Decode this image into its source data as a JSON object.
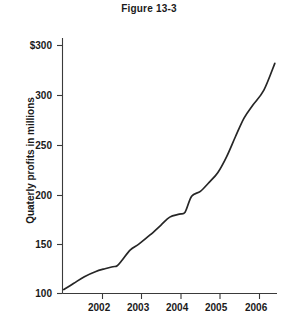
{
  "figure": {
    "title": "Figure 13-3"
  },
  "chart_data": {
    "type": "line",
    "title": "Figure 13-3",
    "xlabel": "",
    "ylabel": "Quaterly profits in millions",
    "grid": false,
    "legend": "none",
    "xlim": [
      2001.75,
      2006.65
    ],
    "ylim": [
      100,
      350
    ],
    "x_tick_labels": [
      "2002",
      "2003",
      "2004",
      "2005",
      "2006"
    ],
    "x_ticks": [
      2002,
      2003,
      2004,
      2005,
      2006
    ],
    "y_tick_labels": [
      "100",
      "150",
      "200",
      "250",
      "300",
      "$300"
    ],
    "y_ticks": [
      100,
      150,
      200,
      250,
      300,
      350
    ],
    "series": [
      {
        "name": "Quaterly profits",
        "x": [
          2001.78,
          2002.0,
          2002.25,
          2002.5,
          2002.72,
          2002.9,
          2003.0,
          2003.12,
          2003.3,
          2003.5,
          2003.75,
          2004.0,
          2004.2,
          2004.42,
          2004.55,
          2004.7,
          2004.9,
          2005.1,
          2005.3,
          2005.5,
          2005.7,
          2005.9,
          2006.1,
          2006.35,
          2006.6
        ],
        "values": [
          104,
          110,
          117,
          122,
          125,
          127,
          128,
          134,
          144,
          150,
          159,
          169,
          177,
          180,
          182,
          198,
          203,
          212,
          222,
          238,
          258,
          277,
          290,
          305,
          332
        ]
      }
    ]
  },
  "axes": {
    "y_axis_label_dollar": "$300",
    "y_axis_label_300": "300",
    "y_axis_label_250": "250",
    "y_axis_label_200": "200",
    "y_axis_label_150": "150",
    "y_axis_label_100": "100",
    "x_axis_label_2002": "2002",
    "x_axis_label_2003": "2003",
    "x_axis_label_2004": "2004",
    "x_axis_label_2005": "2005",
    "x_axis_label_2006": "2006"
  },
  "colors": {
    "line": "#262626",
    "axis": "#3a3a3a",
    "text": "#1a1a1a",
    "background": "#ffffff"
  }
}
